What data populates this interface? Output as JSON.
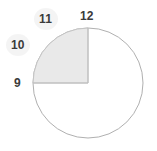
{
  "figure": {
    "background_color": "#ffffff",
    "circle": {
      "center_x": 88,
      "center_y": 83,
      "radius": 55,
      "stroke_color": "#b0b0b0",
      "stroke_width": 1,
      "fill_color": "#ffffff"
    },
    "sector": {
      "label": "shaded-sector",
      "start_hour": "9",
      "end_hour": "12",
      "start_angle_deg": 180,
      "end_angle_deg": 270,
      "sweep_deg": 90,
      "fraction": "1/4",
      "fill_color": "#e9e9e9",
      "stroke_color": "#c4c4c4"
    },
    "radii": [
      {
        "name": "radius-to-9",
        "hour": "9",
        "angle_deg": 180
      },
      {
        "name": "radius-to-12",
        "hour": "12",
        "angle_deg": 270
      }
    ],
    "labels": [
      {
        "name": "tick-label-9",
        "text": "9",
        "x": 14,
        "y": 77,
        "halo": false
      },
      {
        "name": "tick-label-10",
        "text": "10",
        "x": 11,
        "y": 39,
        "halo": true
      },
      {
        "name": "tick-label-11",
        "text": "11",
        "x": 39,
        "y": 13,
        "halo": true
      },
      {
        "name": "tick-label-12",
        "text": "12",
        "x": 80,
        "y": 10,
        "halo": false
      }
    ],
    "label_color": "#3b3b3b",
    "halo_color": "#f2f2f2"
  }
}
